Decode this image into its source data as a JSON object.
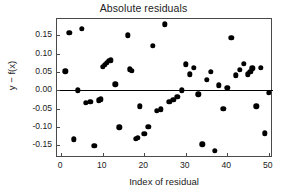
{
  "chart_data": {
    "type": "scatter",
    "title": "Absolute residuals",
    "xlabel": "Index of residual",
    "ylabel": "y − f(x)",
    "xlim": [
      -1,
      51
    ],
    "ylim": [
      -0.185,
      0.195
    ],
    "xticks": [
      0,
      10,
      20,
      30,
      40,
      50
    ],
    "xtick_labels": [
      "0",
      "10",
      "20",
      "30",
      "40",
      "50"
    ],
    "yticks": [
      0.15,
      0.1,
      0.05,
      0.0,
      -0.05,
      -0.1,
      -0.15
    ],
    "ytick_labels": [
      "0.15",
      "0.10",
      "0.05",
      "0.00",
      "-0.05",
      "-0.10",
      "-0.15"
    ],
    "grid": false,
    "legend": null,
    "reference_line": {
      "orientation": "horizontal",
      "y": 0.0,
      "color": "#000000"
    },
    "marker": {
      "shape": "circle",
      "color": "#000000",
      "size": 5.4
    },
    "x": [
      1,
      2,
      3,
      4,
      5,
      6,
      7,
      8,
      9,
      9.5,
      10,
      10.5,
      11,
      11.5,
      12,
      13,
      14,
      16,
      16.5,
      17,
      18,
      18.5,
      19,
      20,
      21,
      22,
      23,
      24,
      25,
      26,
      27,
      28,
      29,
      30,
      31,
      32,
      33,
      34,
      35,
      36,
      37,
      38,
      39,
      40,
      41,
      42,
      43,
      44,
      45,
      45.5,
      46,
      47,
      48,
      49,
      50
    ],
    "y": [
      0.052,
      0.157,
      -0.134,
      0.0,
      0.168,
      -0.034,
      -0.032,
      -0.152,
      -0.027,
      -0.024,
      0.064,
      0.07,
      0.076,
      0.08,
      0.082,
      0.017,
      -0.101,
      0.15,
      0.058,
      0.053,
      -0.133,
      -0.129,
      -0.044,
      -0.119,
      -0.1,
      0.122,
      -0.056,
      -0.052,
      0.181,
      -0.031,
      -0.026,
      -0.018,
      0.0,
      0.071,
      0.044,
      0.062,
      -0.011,
      -0.148,
      0.028,
      0.05,
      -0.166,
      0.014,
      -0.051,
      0.007,
      0.144,
      0.041,
      0.056,
      0.072,
      0.044,
      0.05,
      0.06,
      -0.044,
      0.062,
      -0.118,
      -0.007
    ],
    "n_points": 55
  },
  "figure": {
    "background": "#ffffff",
    "axis_color": "#4a4a4a",
    "text_color": "#222222"
  }
}
